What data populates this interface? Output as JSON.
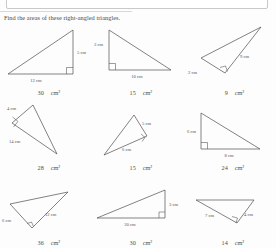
{
  "worksheet": {
    "title": "Find the areas of these right-angled triangles.",
    "unit": "cm",
    "unit_sq": "cm²"
  },
  "problems": [
    {
      "id": 1,
      "labels": {
        "a": "12 cm",
        "b": "5 cm"
      },
      "answer": "30",
      "answer_unit": "cm²"
    },
    {
      "id": 2,
      "labels": {
        "a": "3 cm",
        "b": "10 cm"
      },
      "answer": "15",
      "answer_unit": "cm²"
    },
    {
      "id": 3,
      "labels": {
        "a": "2 cm",
        "b": "9 cm"
      },
      "answer": "9",
      "answer_unit": "cm²"
    },
    {
      "id": 4,
      "labels": {
        "a": "4 cm",
        "b": "14 cm"
      },
      "answer": "28",
      "answer_unit": "cm²"
    },
    {
      "id": 5,
      "labels": {
        "a": "5 cm",
        "b": "6 cm"
      },
      "answer": "15",
      "answer_unit": "cm²"
    },
    {
      "id": 6,
      "labels": {
        "a": "6 cm",
        "b": "8 cm"
      },
      "answer": "24",
      "answer_unit": "cm²"
    },
    {
      "id": 7,
      "labels": {
        "a": "6 cm",
        "b": "12 cm"
      },
      "answer": "36",
      "answer_unit": "cm²"
    },
    {
      "id": 8,
      "labels": {
        "a": "20 cm",
        "b": "3 cm"
      },
      "answer": "30",
      "answer_unit": "cm²"
    },
    {
      "id": 9,
      "labels": {
        "a": "7 cm",
        "b": "4 cm"
      },
      "answer": "14",
      "answer_unit": "cm²"
    }
  ],
  "colors": {
    "ink": "#4d4d4d",
    "text": "#4a4a4a",
    "panel_border": "#c9c9c9",
    "page": "#fdfdfd"
  }
}
